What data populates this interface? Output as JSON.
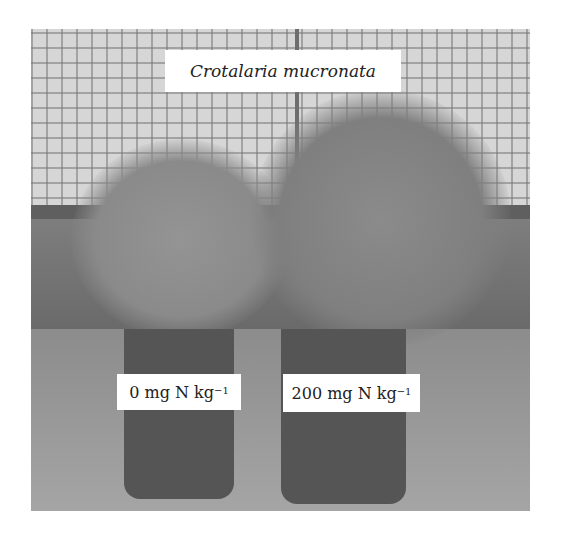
{
  "figure": {
    "title_label": "Crotalaria mucronata",
    "pots": [
      {
        "label_main": "0 mg N kg",
        "label_sup": "−1"
      },
      {
        "label_main": "200 mg N kg",
        "label_sup": "−1"
      }
    ]
  }
}
